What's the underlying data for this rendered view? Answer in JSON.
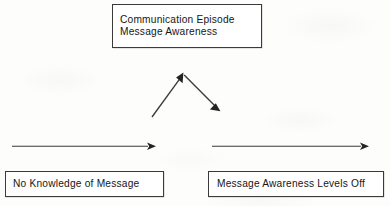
{
  "diagram": {
    "background_color": "#fdfdfc",
    "line_color": "#3b3b3b",
    "text_color": "#161616",
    "border_color": "#3a3a3a",
    "nodes": {
      "top_box": {
        "line1": "Communication Episode",
        "line2": "Message Awareness"
      },
      "bottom_left_box": {
        "label": "No Knowledge of Message"
      },
      "bottom_right_box": {
        "label": "Message Awareness Levels Off"
      }
    },
    "connectors": [
      {
        "name": "rising-awareness-arrow",
        "direction": "up-right",
        "from": [
          152,
          117
        ],
        "to": [
          183,
          74
        ]
      },
      {
        "name": "declining-awareness-arrow",
        "direction": "down-right",
        "from": [
          183,
          74
        ],
        "to": [
          219,
          110
        ]
      },
      {
        "name": "baseline-arrow-left",
        "direction": "right",
        "from": [
          12,
          146
        ],
        "to": [
          155,
          146
        ]
      },
      {
        "name": "baseline-arrow-right",
        "direction": "right",
        "from": [
          212,
          146
        ],
        "to": [
          368,
          146
        ]
      }
    ]
  }
}
